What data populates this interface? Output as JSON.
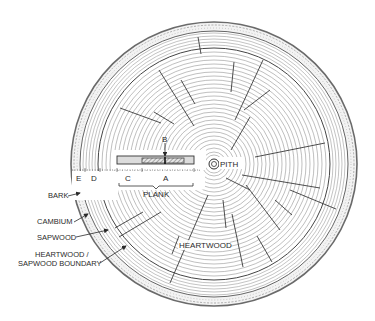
{
  "diagram": {
    "center": {
      "x": 214,
      "y": 163
    },
    "colors": {
      "ink": "#2a2a2a",
      "bark": "#9a9a9a",
      "ring": "#7a7a7a",
      "sapwood": "#b0b0b0",
      "plank_fill": "#dcdcdc",
      "plank_hatch": "#888888"
    },
    "labels": {
      "pith": "PITH",
      "heartwood": "HEARTWOOD",
      "plank": "PLANK",
      "b": "B",
      "a": "A",
      "c": "C",
      "d": "D",
      "e": "E"
    },
    "callouts": [
      {
        "id": "bark",
        "text": "BARK"
      },
      {
        "id": "cambium",
        "text": "CAMBIUM"
      },
      {
        "id": "sapwood",
        "text": "SAPWOOD"
      },
      {
        "id": "boundary_line1",
        "text": "HEARTWOOD /"
      },
      {
        "id": "boundary_line2",
        "text": "SAPWOOD  BOUNDARY"
      }
    ]
  }
}
